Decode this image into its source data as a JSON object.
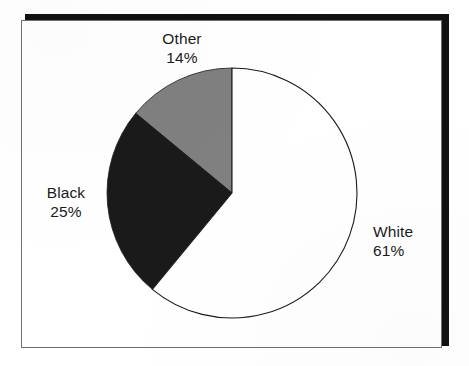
{
  "chart_data": {
    "type": "pie",
    "title": "",
    "subtitle": "",
    "xlabel": "",
    "ylabel": "",
    "legend_position": "none",
    "grid": false,
    "start_angle_deg": 90,
    "direction": "counterclockwise",
    "center": {
      "x": 232,
      "y": 193
    },
    "radius": 125,
    "categories": [
      "Other",
      "Black",
      "White"
    ],
    "values": [
      14,
      25,
      61
    ],
    "value_suffix": "%",
    "slices": [
      {
        "label": "Other",
        "percent_text": "14%",
        "value": 14,
        "color": "#808080",
        "outline": "#1b1b1b",
        "start_deg": 0,
        "sweep_deg": 50.4
      },
      {
        "label": "Black",
        "percent_text": "25%",
        "value": 25,
        "color": "#1a1a1a",
        "outline": "#1a1a1a",
        "start_deg": 50.4,
        "sweep_deg": 90.0
      },
      {
        "label": "White",
        "percent_text": "61%",
        "value": 61,
        "color": "#ffffff",
        "outline": "#1b1b1b",
        "start_deg": 140.4,
        "sweep_deg": 219.6
      }
    ]
  },
  "labels": {
    "other": {
      "name": "Other",
      "percent": "14%"
    },
    "black": {
      "name": "Black",
      "percent": "25%"
    },
    "white": {
      "name": "White",
      "percent": "61%"
    }
  },
  "frame": {
    "border_color": "#6e6e6e",
    "shadow_color": "#111111",
    "background": "#ffffff"
  }
}
